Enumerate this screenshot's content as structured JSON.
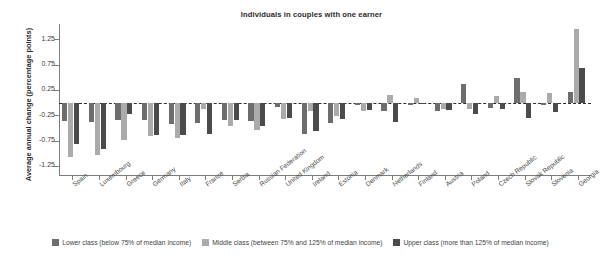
{
  "chart_data": {
    "type": "bar",
    "title": "Individuals in couples with one earner",
    "xlabel": "",
    "ylabel": "Average annual change (percentage points)",
    "ylim": [
      -1.45,
      1.55
    ],
    "yticks": [
      1.25,
      0.75,
      0.25,
      -0.25,
      -0.75,
      -1.25
    ],
    "ytick_labels": [
      "1.25",
      "0.75",
      "0.25",
      "-0.25",
      "-0.75",
      "-1.25"
    ],
    "grid": false,
    "zero_reference_line": true,
    "legend_position": "bottom",
    "categories": [
      "Spain",
      "Luxembourg",
      "Greece",
      "Germany",
      "Italy",
      "France",
      "Serbia",
      "Russian Federation",
      "United Kingdom",
      "Ireland",
      "Estonia",
      "Denmark",
      "Netherlands",
      "Finland",
      "Austria",
      "Poland",
      "Czech Republic",
      "Slovak Republic",
      "Slovenia",
      "Georgia"
    ],
    "series": [
      {
        "name": "Lower class (below 75% of median income)",
        "color": "#6d6d6d",
        "values": [
          -0.36,
          -0.38,
          -0.34,
          -0.35,
          -0.42,
          -0.4,
          -0.35,
          -0.36,
          -0.09,
          -0.62,
          -0.41,
          -0.05,
          -0.17,
          -0.04,
          -0.16,
          0.37,
          -0.1,
          0.48,
          -0.05,
          0.2
        ]
      },
      {
        "name": "Middle class (between 75% and 125% of median income)",
        "color": "#ababab",
        "values": [
          -1.07,
          -1.03,
          -0.74,
          -0.66,
          -0.7,
          -0.13,
          -0.46,
          -0.55,
          -0.33,
          -0.16,
          -0.27,
          -0.17,
          0.14,
          0.08,
          -0.13,
          -0.12,
          0.12,
          0.2,
          0.19,
          1.46
        ]
      },
      {
        "name": "Upper class (more than 125% of median income)",
        "color": "#4b4b4b",
        "values": [
          -0.82,
          -0.91,
          -0.23,
          -0.64,
          -0.64,
          -0.62,
          -0.34,
          -0.47,
          -0.3,
          -0.57,
          -0.33,
          -0.14,
          -0.38,
          -0.03,
          -0.14,
          -0.22,
          -0.13,
          -0.3,
          -0.18,
          0.69
        ]
      }
    ]
  },
  "legend": {
    "items": [
      {
        "label": "Lower class (below 75% of median income)",
        "color": "#6d6d6d"
      },
      {
        "label": "Middle class (between 75% and 125% of median income)",
        "color": "#ababab"
      },
      {
        "label": "Upper class (more than 125% of median income)",
        "color": "#4b4b4b"
      }
    ]
  }
}
